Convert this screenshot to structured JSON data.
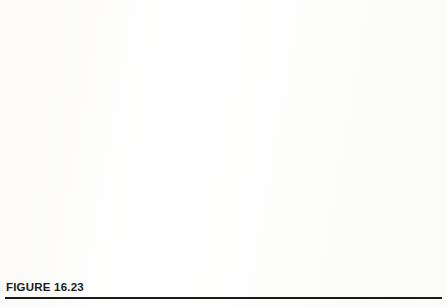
{
  "figure": {
    "caption": "FIGURE 16.23"
  },
  "colors": {
    "series1_bar": "#6f9fd8",
    "series1_swatch": "#6f9fd8",
    "series2_bar": "#c0504d",
    "series2_swatch": "#e06c1a",
    "series3_bar": "#b3d465",
    "series3_swatch": "#9fc75a",
    "gridline": "#c9cfd8",
    "axis": "#b0b7c1",
    "text": "#2b2b2b"
  },
  "legend": {
    "position": "right-middle",
    "entries": [
      {
        "label": "Elevated CO2 Treatment",
        "swatch": "#6f9fd8"
      },
      {
        "label": "Non-Elevated CO2 Treatment #1",
        "swatch": "#e06c1a"
      },
      {
        "label": "Non-Elevated CO2 Treatment #2",
        "swatch": "#9fc75a"
      }
    ]
  },
  "chart_data": {
    "type": "bar",
    "title": "",
    "xlabel": "",
    "ylabel": "",
    "categories": [
      "P %",
      "K %",
      "Ca %",
      "Mg %",
      "S %"
    ],
    "series": [
      {
        "name": "Elevated CO2 Treatment",
        "color": "#6f9fd8",
        "values": [
          0.14,
          0.25,
          0.035,
          0.07,
          0.045
        ]
      },
      {
        "name": "Non-Elevated CO2 Treatment #1",
        "color": "#c0504d",
        "values": [
          0.13,
          0.8,
          0.05,
          0.06,
          0.065
        ]
      },
      {
        "name": "Non-Elevated CO2 Treatment #2",
        "color": "#b3d465",
        "values": [
          0.12,
          0.68,
          0.045,
          0.055,
          0.06
        ]
      }
    ],
    "ylim": [
      0.0,
      0.9
    ],
    "ytick_step": 0.1,
    "yticks": [
      "0.00",
      "0.10",
      "0.20",
      "0.30",
      "0.40",
      "0.50",
      "0.60",
      "0.70",
      "0.80",
      "0.90"
    ],
    "grid": true,
    "legend_position": "right"
  }
}
